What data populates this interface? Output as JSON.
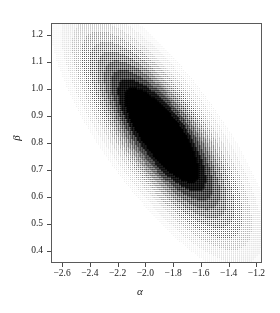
{
  "chart_data": {
    "type": "heatmap",
    "title": "",
    "subtitle": "",
    "xlabel": "α",
    "ylabel": "β",
    "xlim": [
      -2.68,
      -1.16
    ],
    "ylim": [
      0.355,
      1.245
    ],
    "xticks": [
      -2.6,
      -2.4,
      -2.2,
      -2.0,
      -1.8,
      -1.6,
      -1.4,
      -1.2
    ],
    "yticks": [
      0.4,
      0.5,
      0.6,
      0.7,
      0.8,
      0.9,
      1.0,
      1.1,
      1.2
    ],
    "xticklabels": [
      "-2.6",
      "-2.4",
      "-2.2",
      "-2.0",
      "-1.8",
      "-1.6",
      "-1.4",
      "-1.2"
    ],
    "yticklabels": [
      "0.4",
      "0.5",
      "0.6",
      "0.7",
      "0.8",
      "0.9",
      "1.0",
      "1.1",
      "1.2"
    ],
    "grid": false,
    "legend": "none",
    "colormap": "grayscale-stipple",
    "rendering": "dot-stipple grid, darker = higher density",
    "distribution": {
      "kind": "bivariate-gaussian",
      "mean_x": -1.88,
      "mean_y": 0.83,
      "sigma_x": 0.235,
      "sigma_y": 0.155,
      "correlation": -0.78,
      "peak_x": -1.88,
      "peak_y": 0.83
    },
    "contour_levels": [
      0.1,
      0.25,
      0.45,
      0.65,
      0.85,
      1.0
    ],
    "stipple": {
      "cell_size_px": 2,
      "max_dot_px": 2,
      "dot_color": "#000000",
      "background": "#ffffff"
    }
  },
  "axes": {
    "frame_color": "#5a5a5a",
    "tick_color": "#4a4a4a",
    "text_color": "#1a1a1a"
  }
}
